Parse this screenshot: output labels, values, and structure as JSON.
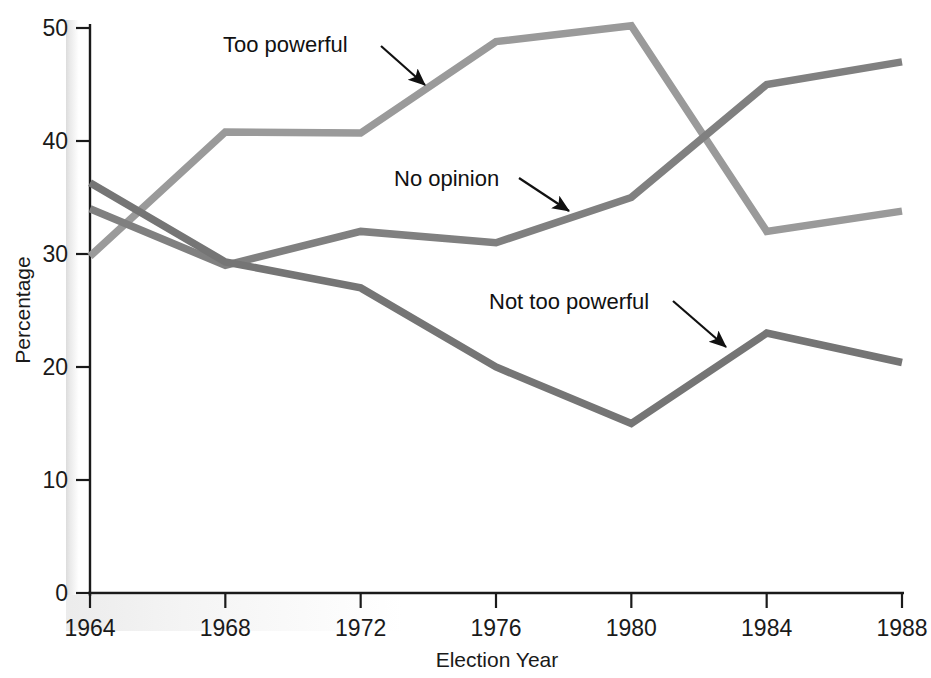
{
  "chart_data": {
    "type": "line",
    "title": "",
    "xlabel": "Election Year",
    "ylabel": "Percentage",
    "x": [
      1964,
      1968,
      1972,
      1976,
      1980,
      1984,
      1988
    ],
    "xtick_labels": [
      "1964",
      "1968",
      "1972",
      "1976",
      "1980",
      "1984",
      "1988"
    ],
    "ytick_labels": [
      "0",
      "10",
      "20",
      "30",
      "40",
      "50"
    ],
    "yticks": [
      0,
      10,
      20,
      30,
      40,
      50
    ],
    "ylim": [
      0,
      50
    ],
    "xlim": [
      1964,
      1988
    ],
    "grid": false,
    "legend_position": "inline-annotations",
    "series": [
      {
        "name": "Too powerful",
        "color": "#9a9a9a",
        "values": [
          29.8,
          40.8,
          40.7,
          48.8,
          50.2,
          32.0,
          33.8
        ]
      },
      {
        "name": "No opinion",
        "color": "#808080",
        "values": [
          34.0,
          29.0,
          32.0,
          31.0,
          35.0,
          45.0,
          47.0
        ]
      },
      {
        "name": "Not too powerful",
        "color": "#757575",
        "values": [
          36.3,
          29.3,
          27.0,
          20.0,
          15.0,
          23.0,
          20.4
        ]
      }
    ],
    "annotations": [
      {
        "label": "Too powerful",
        "text_x": 223,
        "text_y": 52,
        "arrow_x1": 381,
        "arrow_y1": 46,
        "arrow_x2": 425,
        "arrow_y2": 85
      },
      {
        "label": "No opinion",
        "text_x": 394,
        "text_y": 186,
        "arrow_x1": 519,
        "arrow_y1": 178,
        "arrow_x2": 569,
        "arrow_y2": 211
      },
      {
        "label": "Not too powerful",
        "text_x": 489,
        "text_y": 309,
        "arrow_x1": 673,
        "arrow_y1": 301,
        "arrow_x2": 726,
        "arrow_y2": 347
      }
    ]
  },
  "axes": {
    "x_axis_label": "Election Year",
    "y_axis_label": "Percentage"
  },
  "colors": {
    "axis": "#1a1a1a",
    "background": "#ffffff",
    "series_light": "#9a9a9a",
    "series_mid": "#808080",
    "series_dark": "#757575"
  }
}
